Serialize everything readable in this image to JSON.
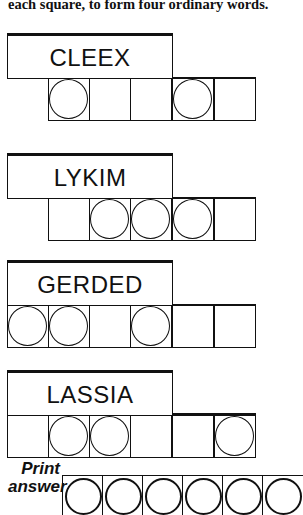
{
  "instructions": "each square, to form four ordinary words.",
  "puzzles": [
    {
      "scrambled": "CLEEX",
      "length": 5,
      "circled": [
        0,
        3
      ]
    },
    {
      "scrambled": "LYKIM",
      "length": 5,
      "circled": [
        1,
        2,
        3
      ]
    },
    {
      "scrambled": "GERDED",
      "length": 6,
      "circled": [
        0,
        1,
        3
      ]
    },
    {
      "scrambled": "LASSIA",
      "length": 6,
      "circled": [
        1,
        2,
        5
      ]
    }
  ],
  "answer_section": {
    "label_line1": "Print",
    "label_line2": "answer",
    "cells": 6
  }
}
